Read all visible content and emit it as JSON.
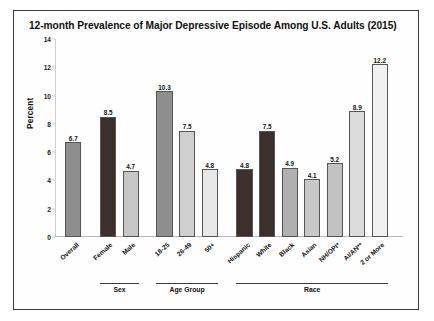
{
  "figure": {
    "title": "12-month Prevalence of Major Depressive Episode Among U.S. Adults (2015)",
    "border_color": "#3a3a3a",
    "background": "#fefefe"
  },
  "chart_data": {
    "type": "bar",
    "title": "12-month Prevalence of Major Depressive Episode Among U.S. Adults (2015)",
    "xlabel": "",
    "ylabel": "Percent",
    "ylim": [
      0,
      14
    ],
    "yticks": [
      0,
      2,
      4,
      6,
      8,
      10,
      12,
      14
    ],
    "ytick_labels": [
      "0",
      "2",
      "4",
      "6",
      "8",
      "10",
      "12",
      "14"
    ],
    "grid": false,
    "legend": "none",
    "categories": [
      "Overall",
      "Female",
      "Male",
      "18-25",
      "26-49",
      "50+",
      "Hispanic",
      "White",
      "Black",
      "Asian",
      "NH/OPI*",
      "AI/AN**",
      "2 or More"
    ],
    "values": [
      6.7,
      8.5,
      4.7,
      10.3,
      7.5,
      4.8,
      4.8,
      7.5,
      4.9,
      4.1,
      5.2,
      8.9,
      12.2
    ],
    "value_labels": [
      "6.7",
      "8.5",
      "4.7",
      "10.3",
      "7.5",
      "4.8",
      "4.8",
      "7.5",
      "4.9",
      "4.1",
      "5.2",
      "8.9",
      "12.2"
    ],
    "bar_colors": [
      "#8e8e8e",
      "#3c302c",
      "#c6c6c6",
      "#8e8e8e",
      "#cfcfcf",
      "#e8e8e8",
      "#3c302c",
      "#3c302c",
      "#b0b0b0",
      "#c8c8c8",
      "#c2c2c2",
      "#dcdcdc",
      "#f1f1f1"
    ],
    "groups": [
      {
        "label": "Sex",
        "start_index": 1,
        "end_index": 2
      },
      {
        "label": "Age Group",
        "start_index": 3,
        "end_index": 5
      },
      {
        "label": "Race",
        "start_index": 6,
        "end_index": 12
      }
    ]
  }
}
